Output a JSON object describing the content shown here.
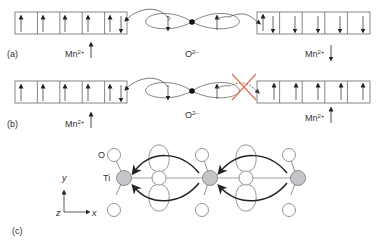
{
  "figure": {
    "panels": [
      {
        "id": "a",
        "label": "(a)",
        "left_ion": "Mn",
        "left_charge": "2+",
        "left_spin": "up",
        "center_ion": "O",
        "center_charge": "2–",
        "right_ion": "Mn",
        "right_charge": "2+",
        "right_spin": "down"
      },
      {
        "id": "b",
        "label": "(b)",
        "left_ion": "Mn",
        "left_charge": "2+",
        "left_spin": "up",
        "center_ion": "O",
        "center_charge": "2–",
        "right_ion": "Mn",
        "right_charge": "2+",
        "right_spin": "up",
        "blocked_marker": "red-x"
      },
      {
        "id": "c",
        "label": "(c)",
        "atom_O": "O",
        "atom_Ti": "Ti",
        "axis_y": "y",
        "axis_z": "z",
        "axis_x": "x"
      }
    ],
    "colors": {
      "line": "#555555",
      "arrow": "#222222",
      "ti_fill": "#c4c6ca",
      "cross": "#e0755a"
    }
  }
}
